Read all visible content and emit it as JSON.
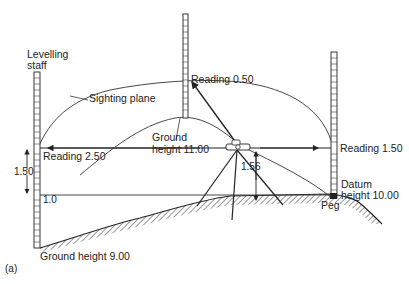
{
  "figure": {
    "caption": "(a)",
    "colors": {
      "ink": "#222222",
      "background": "#ffffff"
    }
  },
  "labels": {
    "levelling_staff_line1": "Levelling",
    "levelling_staff_line2": "staff",
    "sighting_plane": "Sighting plane",
    "reading_left": "Reading 2.50",
    "reading_middle": "Reading 0.50",
    "reading_right": "Reading 1.50",
    "ground_mid_line1": "Ground",
    "ground_mid_line2": "height 11.00",
    "instrument_height": "1.56",
    "left_difference": "1.50",
    "left_staff_mark": "1.0",
    "datum_line1": "Datum",
    "datum_line2": "height 10.00",
    "peg": "Peg",
    "ground_left": "Ground height 9.00"
  }
}
